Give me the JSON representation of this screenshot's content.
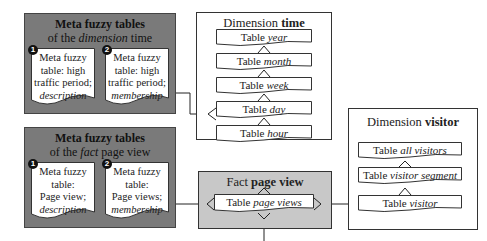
{
  "meta_time": {
    "title": "Meta fuzzy tables",
    "subtitle_pre": "of the ",
    "subtitle_em": "dimension",
    "subtitle_post": " time",
    "docs": [
      {
        "num": "1",
        "line1": "Meta fuzzy",
        "line2": "table: high",
        "line3": "traffic period;",
        "line4": "description"
      },
      {
        "num": "2",
        "line1": "Meta fuzzy",
        "line2": "table: high",
        "line3": "traffic period;",
        "line4": "membership"
      }
    ]
  },
  "meta_fact": {
    "title": "Meta fuzzy tables",
    "subtitle_pre": "of the ",
    "subtitle_em": "fact",
    "subtitle_post": " page view",
    "docs": [
      {
        "num": "1",
        "line1": "Meta fuzzy",
        "line2": "table:",
        "line3": "Page view;",
        "line4": "description"
      },
      {
        "num": "2",
        "line1": "Meta fuzzy",
        "line2": "table:",
        "line3": "Page views;",
        "line4": "membership"
      }
    ]
  },
  "dim_time": {
    "title_pre": "Dimension ",
    "title_bold": "time",
    "tables": [
      {
        "pre": "Table ",
        "em": "year"
      },
      {
        "pre": "Table ",
        "em": "month"
      },
      {
        "pre": "Table ",
        "em": "week"
      },
      {
        "pre": "Table ",
        "em": "day"
      },
      {
        "pre": "Table ",
        "em": "hour"
      }
    ]
  },
  "fact": {
    "title_pre": "Fact ",
    "title_bold": "page view",
    "table": {
      "pre": "Table ",
      "em": "page views"
    }
  },
  "dim_visitor": {
    "title_pre": "Dimension ",
    "title_bold": "visitor",
    "tables": [
      {
        "pre": "Table ",
        "em": "all visitors"
      },
      {
        "pre": "Table ",
        "em": "visitor segment"
      },
      {
        "pre": "Table ",
        "em": "visitor"
      }
    ]
  }
}
